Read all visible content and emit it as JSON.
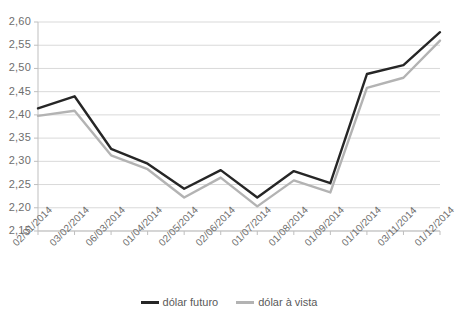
{
  "chart_data": {
    "type": "line",
    "title": "",
    "subtitle": "",
    "xlabel": "",
    "ylabel": "",
    "ylim": [
      2.15,
      2.6
    ],
    "ytick_step": 0.05,
    "grid": true,
    "legend_position": "bottom",
    "decimal_separator": ",",
    "categories": [
      "02/01/2014",
      "03/02/2014",
      "06/03/2014",
      "01/04/2014",
      "02/05/2014",
      "02/06/2014",
      "01/07/2014",
      "01/08/2014",
      "01/09/2014",
      "01/10/2014",
      "03/11/2014",
      "01/12/2014"
    ],
    "ytick_labels": [
      "2,60",
      "2,55",
      "2,50",
      "2,45",
      "2,40",
      "2,35",
      "2,30",
      "2,25",
      "2,20",
      "2,15"
    ],
    "ytick_values": [
      2.6,
      2.55,
      2.5,
      2.45,
      2.4,
      2.35,
      2.3,
      2.25,
      2.2,
      2.15
    ],
    "series": [
      {
        "name": "dólar futuro",
        "color": "#262626",
        "values": [
          2.414,
          2.44,
          2.327,
          2.295,
          2.241,
          2.281,
          2.222,
          2.279,
          2.253,
          2.488,
          2.507,
          2.578
        ]
      },
      {
        "name": "dólar à vista",
        "color": "#b3b3b3",
        "values": [
          2.398,
          2.409,
          2.313,
          2.283,
          2.222,
          2.265,
          2.203,
          2.259,
          2.233,
          2.458,
          2.48,
          2.56
        ]
      }
    ]
  },
  "legend": {
    "items": [
      {
        "label": "dólar futuro",
        "color": "#262626"
      },
      {
        "label": "dólar à vista",
        "color": "#b3b3b3"
      }
    ]
  },
  "colors": {
    "grid": "#d9d9d9",
    "axis": "#bfbfbf",
    "text": "#6e6e6e",
    "background": "#ffffff",
    "series_futuro": "#262626",
    "series_vista": "#b3b3b3"
  }
}
